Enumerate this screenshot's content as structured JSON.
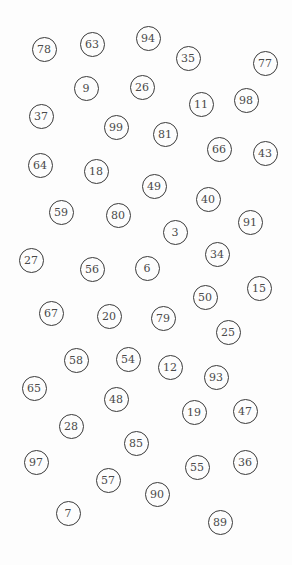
{
  "title": "",
  "colors": {
    "background": "#fdfdfd",
    "circle_stroke": "#3a3a3a",
    "number_text": "#4a4a4a"
  },
  "circles": [
    {
      "label": "78",
      "x": 44,
      "y": 49
    },
    {
      "label": "63",
      "x": 92,
      "y": 44
    },
    {
      "label": "94",
      "x": 148,
      "y": 38
    },
    {
      "label": "35",
      "x": 188,
      "y": 58
    },
    {
      "label": "77",
      "x": 265,
      "y": 63
    },
    {
      "label": "9",
      "x": 86,
      "y": 88
    },
    {
      "label": "26",
      "x": 142,
      "y": 87
    },
    {
      "label": "11",
      "x": 201,
      "y": 104
    },
    {
      "label": "98",
      "x": 246,
      "y": 100
    },
    {
      "label": "37",
      "x": 41,
      "y": 116
    },
    {
      "label": "99",
      "x": 116,
      "y": 127
    },
    {
      "label": "81",
      "x": 165,
      "y": 134
    },
    {
      "label": "66",
      "x": 219,
      "y": 149
    },
    {
      "label": "43",
      "x": 265,
      "y": 153
    },
    {
      "label": "64",
      "x": 40,
      "y": 165
    },
    {
      "label": "18",
      "x": 96,
      "y": 171
    },
    {
      "label": "49",
      "x": 154,
      "y": 186
    },
    {
      "label": "40",
      "x": 208,
      "y": 199
    },
    {
      "label": "59",
      "x": 61,
      "y": 212
    },
    {
      "label": "80",
      "x": 118,
      "y": 215
    },
    {
      "label": "3",
      "x": 175,
      "y": 232
    },
    {
      "label": "91",
      "x": 250,
      "y": 222
    },
    {
      "label": "27",
      "x": 31,
      "y": 260
    },
    {
      "label": "34",
      "x": 217,
      "y": 254
    },
    {
      "label": "56",
      "x": 92,
      "y": 269
    },
    {
      "label": "6",
      "x": 147,
      "y": 268
    },
    {
      "label": "15",
      "x": 259,
      "y": 288
    },
    {
      "label": "50",
      "x": 205,
      "y": 297
    },
    {
      "label": "67",
      "x": 51,
      "y": 313
    },
    {
      "label": "20",
      "x": 109,
      "y": 316
    },
    {
      "label": "79",
      "x": 163,
      "y": 318
    },
    {
      "label": "25",
      "x": 228,
      "y": 332
    },
    {
      "label": "58",
      "x": 76,
      "y": 360
    },
    {
      "label": "54",
      "x": 128,
      "y": 359
    },
    {
      "label": "12",
      "x": 170,
      "y": 367
    },
    {
      "label": "93",
      "x": 216,
      "y": 377
    },
    {
      "label": "65",
      "x": 34,
      "y": 388
    },
    {
      "label": "48",
      "x": 116,
      "y": 399
    },
    {
      "label": "19",
      "x": 194,
      "y": 412
    },
    {
      "label": "47",
      "x": 245,
      "y": 411
    },
    {
      "label": "28",
      "x": 71,
      "y": 426
    },
    {
      "label": "85",
      "x": 136,
      "y": 443
    },
    {
      "label": "97",
      "x": 36,
      "y": 462
    },
    {
      "label": "55",
      "x": 197,
      "y": 467
    },
    {
      "label": "36",
      "x": 245,
      "y": 462
    },
    {
      "label": "57",
      "x": 108,
      "y": 480
    },
    {
      "label": "90",
      "x": 157,
      "y": 494
    },
    {
      "label": "7",
      "x": 68,
      "y": 513
    },
    {
      "label": "89",
      "x": 220,
      "y": 522
    }
  ]
}
